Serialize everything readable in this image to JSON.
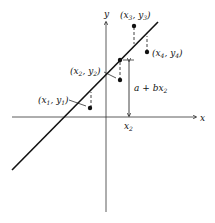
{
  "diagram": {
    "axes": {
      "x_label": "x",
      "y_label": "y"
    },
    "points": [
      {
        "label": "(x1, y1)",
        "x": 90,
        "y": 108
      },
      {
        "label": "(x2, y2)",
        "x": 119,
        "y": 80
      },
      {
        "label": "(x3, y3)",
        "x": 134,
        "y": 26
      },
      {
        "label": "(x4, y4)",
        "x": 147,
        "y": 52
      }
    ],
    "fitted_point_label": "a + bx2",
    "x2_tick_label": "x2",
    "line": "regression line y = a + bx",
    "colors": {
      "ink": "#111111",
      "background": "#ffffff"
    }
  }
}
